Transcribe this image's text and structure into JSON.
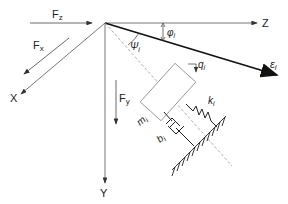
{
  "diagram": {
    "axes": {
      "x_label": "X",
      "y_label": "Y",
      "z_label": "Z",
      "epsilon_label": "ε",
      "epsilon_sub": "i"
    },
    "forces": {
      "fz_label": "F",
      "fz_sub": "z",
      "fx_label": "F",
      "fx_sub": "x",
      "fy_label": "F",
      "fy_sub": "y"
    },
    "angles": {
      "phi_label": "φ",
      "phi_sub": "i",
      "psi_label": "Ψ",
      "psi_sub": "i"
    },
    "element": {
      "mass_label": "m",
      "mass_sub": "i",
      "spring_label": "k",
      "spring_sub": "i",
      "damper_label": "b",
      "damper_sub": "i",
      "displacement_label": "q",
      "displacement_sub": "i"
    },
    "colors": {
      "line": "#333333",
      "thick_line": "#111111",
      "dashed": "#999999"
    }
  }
}
